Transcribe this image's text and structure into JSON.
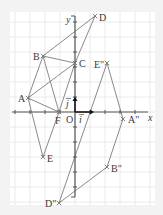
{
  "figure": {
    "background": "#f3f3f3",
    "panel_color": "#ffffff",
    "grid_color": "#e4e4e4",
    "line_color": "#8a8a8a",
    "axis_color": "#555555",
    "unit_px": 15,
    "origin_px": [
      75,
      112
    ]
  },
  "axes": {
    "x_label": "x",
    "y_label": "y",
    "origin_label": "O",
    "i_label": "i",
    "j_label": "j"
  },
  "points": [
    {
      "name": "A",
      "label": "A",
      "px": [
        28,
        98
      ]
    },
    {
      "name": "B",
      "label": "B",
      "px": [
        43,
        56
      ]
    },
    {
      "name": "C",
      "label": "C",
      "px": [
        75,
        63
      ]
    },
    {
      "name": "D",
      "label": "D",
      "px": [
        95,
        16
      ]
    },
    {
      "name": "E",
      "label": "E",
      "px": [
        43,
        157
      ]
    },
    {
      "name": "F",
      "label": "F",
      "px": [
        59,
        112
      ]
    },
    {
      "name": "E2",
      "label": "E\"",
      "px": [
        107,
        63
      ]
    },
    {
      "name": "A2",
      "label": "A\"",
      "px": [
        123,
        119
      ]
    },
    {
      "name": "B2",
      "label": "B\"",
      "px": [
        107,
        167
      ]
    },
    {
      "name": "D2",
      "label": "D\"",
      "px": [
        59,
        203
      ]
    }
  ],
  "segments": [
    [
      "A",
      "B"
    ],
    [
      "A",
      "C"
    ],
    [
      "A",
      "F"
    ],
    [
      "A",
      "E"
    ],
    [
      "B",
      "C"
    ],
    [
      "B",
      "D"
    ],
    [
      "B",
      "F"
    ],
    [
      "C",
      "D"
    ],
    [
      "C",
      "F"
    ],
    [
      "F",
      "E"
    ],
    [
      "E2",
      "D2"
    ],
    [
      "E2",
      "A2"
    ],
    [
      "A2",
      "B2"
    ],
    [
      "B2",
      "D2"
    ]
  ]
}
